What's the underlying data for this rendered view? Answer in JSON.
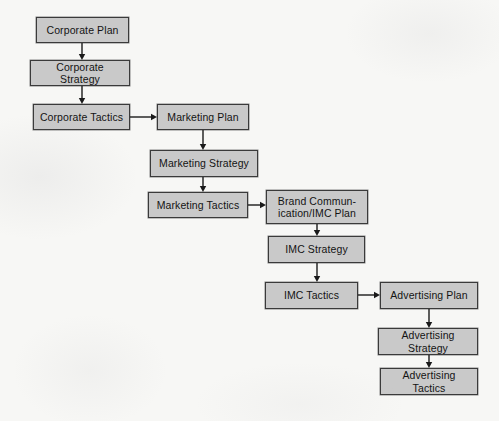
{
  "diagram": {
    "background_color": "#f7f7f5",
    "node_fill_color": "#c9c9c9",
    "node_border_color": "#3a3a3a",
    "connector_color": "#1a1a1a",
    "nodes": [
      {
        "id": "corporate-plan",
        "label": "Corporate Plan",
        "x": 36,
        "y": 17,
        "w": 93,
        "h": 26
      },
      {
        "id": "corporate-strategy",
        "label": "Corporate Strategy",
        "x": 30,
        "y": 60,
        "w": 100,
        "h": 26
      },
      {
        "id": "corporate-tactics",
        "label": "Corporate Tactics",
        "x": 33,
        "y": 104,
        "w": 97,
        "h": 26
      },
      {
        "id": "marketing-plan",
        "label": "Marketing Plan",
        "x": 157,
        "y": 104,
        "w": 92,
        "h": 26
      },
      {
        "id": "marketing-strategy",
        "label": "Marketing Strategy",
        "x": 150,
        "y": 150,
        "w": 108,
        "h": 27
      },
      {
        "id": "marketing-tactics",
        "label": "Marketing Tactics",
        "x": 148,
        "y": 192,
        "w": 100,
        "h": 26
      },
      {
        "id": "brand-communication",
        "label": "Brand Commun-\nication/IMC Plan",
        "x": 266,
        "y": 190,
        "w": 102,
        "h": 34
      },
      {
        "id": "imc-strategy",
        "label": "IMC Strategy",
        "x": 268,
        "y": 236,
        "w": 97,
        "h": 27
      },
      {
        "id": "imc-tactics",
        "label": "IMC Tactics",
        "x": 265,
        "y": 282,
        "w": 93,
        "h": 27
      },
      {
        "id": "advertising-plan",
        "label": "Advertising Plan",
        "x": 380,
        "y": 282,
        "w": 98,
        "h": 27
      },
      {
        "id": "advertising-strategy",
        "label": "Advertising Strategy",
        "x": 378,
        "y": 328,
        "w": 100,
        "h": 27
      },
      {
        "id": "advertising-tactics",
        "label": "Advertising Tactics",
        "x": 380,
        "y": 368,
        "w": 98,
        "h": 27
      }
    ],
    "edges": [
      {
        "id": "edge-corporate-plan-to-corporate-strategy",
        "from": "corporate-plan",
        "to": "corporate-strategy",
        "orientation": "vertical",
        "x": 82,
        "y": 43,
        "length": 17
      },
      {
        "id": "edge-corporate-strategy-to-corporate-tactics",
        "from": "corporate-strategy",
        "to": "corporate-tactics",
        "orientation": "vertical",
        "x": 82,
        "y": 86,
        "length": 18
      },
      {
        "id": "edge-corporate-tactics-to-marketing-plan",
        "from": "corporate-tactics",
        "to": "marketing-plan",
        "orientation": "horizontal",
        "x": 130,
        "y": 117,
        "length": 27
      },
      {
        "id": "edge-marketing-plan-to-marketing-strategy",
        "from": "marketing-plan",
        "to": "marketing-strategy",
        "orientation": "vertical",
        "x": 203,
        "y": 130,
        "length": 20
      },
      {
        "id": "edge-marketing-strategy-to-marketing-tactics",
        "from": "marketing-strategy",
        "to": "marketing-tactics",
        "orientation": "vertical",
        "x": 203,
        "y": 177,
        "length": 15
      },
      {
        "id": "edge-marketing-tactics-to-brand-communication",
        "from": "marketing-tactics",
        "to": "brand-communication",
        "orientation": "horizontal",
        "x": 248,
        "y": 205,
        "length": 18
      },
      {
        "id": "edge-brand-communication-to-imc-strategy",
        "from": "brand-communication",
        "to": "imc-strategy",
        "orientation": "vertical",
        "x": 317,
        "y": 224,
        "length": 12
      },
      {
        "id": "edge-imc-strategy-to-imc-tactics",
        "from": "imc-strategy",
        "to": "imc-tactics",
        "orientation": "vertical",
        "x": 317,
        "y": 263,
        "length": 19
      },
      {
        "id": "edge-imc-tactics-to-advertising-plan",
        "from": "imc-tactics",
        "to": "advertising-plan",
        "orientation": "horizontal",
        "x": 358,
        "y": 295,
        "length": 22
      },
      {
        "id": "edge-advertising-plan-to-advertising-strategy",
        "from": "advertising-plan",
        "to": "advertising-strategy",
        "orientation": "vertical",
        "x": 429,
        "y": 309,
        "length": 19
      },
      {
        "id": "edge-advertising-strategy-to-advertising-tactics",
        "from": "advertising-strategy",
        "to": "advertising-tactics",
        "orientation": "vertical",
        "x": 429,
        "y": 355,
        "length": 13
      }
    ]
  }
}
